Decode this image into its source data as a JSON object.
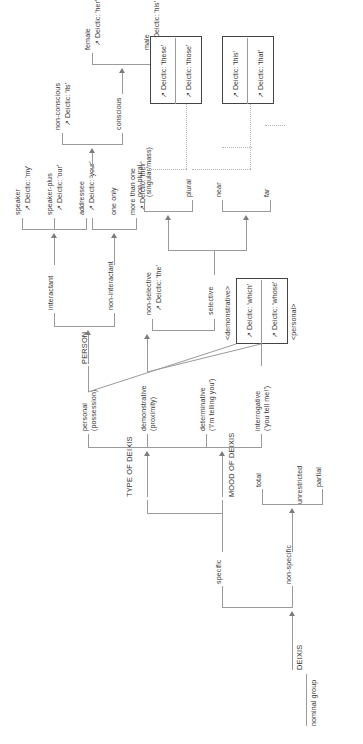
{
  "diagram": {
    "title": "DEIXIS",
    "entry": {
      "rank": "nominal group",
      "system": "DEIXIS"
    },
    "arrow_glyph": "↗",
    "terms": {
      "specific": "specific",
      "non_specific": "non-specific",
      "total": "total",
      "partial": "partial",
      "unrestricted": "unrestricted",
      "type_of_deixis": "TYPE OF DEIXIS",
      "mood_of_deixis": "MOOD OF DEIXIS",
      "personal": "personal",
      "personal_gloss": "(possession)",
      "demonstrative": "demonstrative",
      "demonstrative_gloss": "(proximity)",
      "determinative": "determinative",
      "determinative_gloss": "('I'm telling you')",
      "interrogative": "interrogative",
      "interrogative_gloss": "('you tell me!')",
      "person": "PERSON",
      "interactant": "interactant",
      "non_interactant": "non-interactant",
      "speaker": "speaker",
      "speaker_plus": "speaker-plus",
      "addressee": "addressee",
      "one_only": "one only",
      "more_than_one": "more than one",
      "conscious": "conscious",
      "non_conscious": "non-conscious",
      "male": "male",
      "female": "female",
      "non_selective": "non-selective",
      "selective": "selective",
      "non_plural": "non-plural",
      "non_plural_gloss": "(singular/mass)",
      "plural": "plural",
      "near": "near",
      "far": "far",
      "demonstrative_feature": "<demonstrative>",
      "personal_feature": "<personal>"
    },
    "realisations": {
      "my": "Deictic: 'my'",
      "our": "Deictic: 'our'",
      "your": "Deictic: 'your'",
      "their": "Deictic: 'their'",
      "its": "Deictic: 'its'",
      "his": "Deictic: 'his'",
      "her": "Deictic: 'her'",
      "the": "Deictic: 'the'",
      "this": "Deictic: 'this'",
      "that": "Deictic: 'that'",
      "these": "Deictic: 'these'",
      "those": "Deictic: 'those'",
      "which": "Deictic: 'which'",
      "whose": "Deictic: 'whose'"
    },
    "colors": {
      "line": "#9a9a9a",
      "text": "#3a3a3a",
      "box_border": "#555555",
      "dotted": "#b5b5b5",
      "background": "#ffffff"
    }
  }
}
